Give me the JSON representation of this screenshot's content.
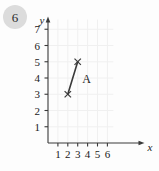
{
  "badge": {
    "number": "6"
  },
  "chart_data": {
    "type": "line",
    "title": "",
    "xlabel": "x",
    "ylabel": "y",
    "xlim": [
      0,
      6.6
    ],
    "ylim": [
      0,
      7.6
    ],
    "grid": true,
    "legend": "none",
    "xticks": [
      "1",
      "2",
      "3",
      "4",
      "5",
      "6"
    ],
    "yticks": [
      "1",
      "2",
      "3",
      "4",
      "5",
      "6",
      "7"
    ],
    "xtick_values": [
      1,
      2,
      3,
      4,
      5,
      6
    ],
    "ytick_values": [
      1,
      2,
      3,
      4,
      5,
      6,
      7
    ],
    "series": [
      {
        "name": "A",
        "marker": "x",
        "x": [
          2,
          3
        ],
        "y": [
          3,
          5
        ],
        "points": [
          {
            "x": 2,
            "y": 3
          },
          {
            "x": 3,
            "y": 5
          }
        ],
        "label": "A",
        "label_x": 3.45,
        "label_y": 3.7
      }
    ],
    "colors": {
      "line": "#3a3a3a",
      "axis": "#3a3a3a",
      "grid": "#f0f0f0",
      "text": "#1a1a1a",
      "background": "#fdfdfd"
    }
  }
}
